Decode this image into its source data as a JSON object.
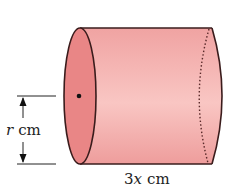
{
  "figure": {
    "type": "cylinder-diagram",
    "labels": {
      "radius": {
        "var": "r",
        "unit": "cm"
      },
      "length": {
        "var": "3x",
        "coef": "3",
        "sym": "x",
        "unit": "cm"
      }
    },
    "colors": {
      "body": "#f2a6a6",
      "body_highlight": "#f8c4c2",
      "face": "#e98585",
      "outline": "#3a1c1c",
      "text": "#222222"
    }
  }
}
